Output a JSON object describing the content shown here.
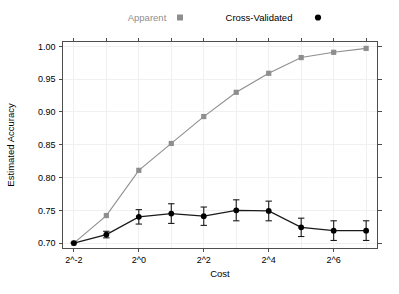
{
  "chart_data": {
    "type": "line",
    "title": "",
    "xlabel": "Cost",
    "ylabel": "Estimated Accuracy",
    "xscale": "log2",
    "xlim": [
      -2.35,
      7.35
    ],
    "ylim": [
      0.6925,
      1.0075
    ],
    "grid": true,
    "legend_position": "top",
    "x_tick_labels": [
      "2^-2",
      "2^0",
      "2^2",
      "2^4",
      "2^6"
    ],
    "x_tick_values": [
      -2,
      0,
      2,
      4,
      6
    ],
    "x_minor_tick_values": [
      -1,
      1,
      3,
      5,
      7
    ],
    "y_tick_labels": [
      "0.70",
      "0.75",
      "0.80",
      "0.85",
      "0.90",
      "0.95",
      "1.00"
    ],
    "y_tick_values": [
      0.7,
      0.75,
      0.8,
      0.85,
      0.9,
      0.95,
      1.0
    ],
    "x": [
      -2,
      -1,
      0,
      1,
      2,
      3,
      4,
      5,
      6,
      7
    ],
    "series": [
      {
        "name": "Apparent",
        "marker": "square",
        "color": "#8e8e8e",
        "values": [
          0.7,
          0.742,
          0.811,
          0.852,
          0.893,
          0.93,
          0.959,
          0.983,
          0.991,
          0.997
        ]
      },
      {
        "name": "Cross-Validated",
        "marker": "circle",
        "color": "#000000",
        "values": [
          0.7,
          0.713,
          0.74,
          0.745,
          0.741,
          0.75,
          0.749,
          0.724,
          0.719,
          0.719
        ],
        "error_low": [
          0.7,
          0.708,
          0.729,
          0.73,
          0.727,
          0.734,
          0.734,
          0.71,
          0.704,
          0.704
        ],
        "error_high": [
          0.701,
          0.718,
          0.751,
          0.76,
          0.755,
          0.766,
          0.764,
          0.738,
          0.734,
          0.734
        ]
      }
    ]
  },
  "legend": {
    "entries": [
      {
        "label": "Apparent",
        "marker": "square",
        "color": "#8e8e8e"
      },
      {
        "label": "Cross-Validated",
        "marker": "circle",
        "color": "#000000"
      }
    ]
  },
  "axes": {
    "x_title": "Cost",
    "y_title": "Estimated Accuracy"
  }
}
